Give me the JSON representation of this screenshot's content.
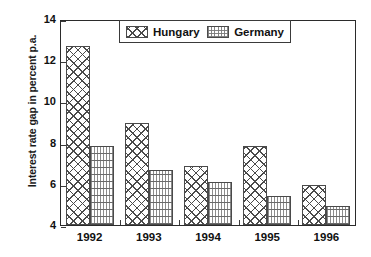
{
  "chart_data": {
    "type": "bar",
    "title": "",
    "subtitle": "",
    "xlabel": "",
    "ylabel": "Interest rate gap in percent p.a.",
    "categories": [
      "1992",
      "1993",
      "1994",
      "1995",
      "1996"
    ],
    "series": [
      {
        "name": "Hungary",
        "pattern": "cross-hatch",
        "values": [
          12.7,
          8.95,
          6.85,
          7.85,
          5.95
        ]
      },
      {
        "name": "Germany",
        "pattern": "horizontal-lines-dotted",
        "values": [
          7.85,
          6.65,
          6.1,
          5.4,
          4.9
        ]
      }
    ],
    "ylim": [
      4,
      14
    ],
    "yticks": [
      4,
      6,
      8,
      10,
      12,
      14
    ],
    "ytick_labels": [
      "4",
      "6",
      "8",
      "10",
      "12",
      "14"
    ],
    "grid": false,
    "legend_position": "top-center",
    "legend_entries": [
      "Hungary",
      "Germany"
    ],
    "annotations": []
  },
  "colors": {
    "axis": "#2b2b2b",
    "text": "#111111",
    "hatch": "#4a4a4a",
    "stipple": "#6a6a6a",
    "background": "#ffffff"
  }
}
